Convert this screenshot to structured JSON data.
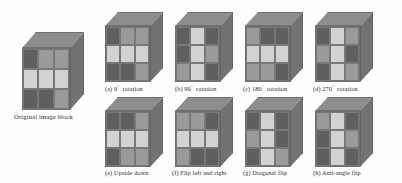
{
  "figure": {
    "type": "diagram",
    "shades": {
      "dark": "#5f5f5f",
      "mid": "#9a9a9a",
      "light": "#d2d2d2",
      "top_face": "#8d8d8d",
      "right_face": "#727272",
      "background": "#fdfdfd"
    }
  },
  "original": {
    "caption": "Original image block",
    "grid": [
      [
        "dark",
        "mid",
        "mid"
      ],
      [
        "light",
        "light",
        "light"
      ],
      [
        "dark",
        "dark",
        "mid"
      ]
    ]
  },
  "panels": [
    {
      "id": "a",
      "label": "(a) 0",
      "degree": "°",
      "suffix": "rotation",
      "caption": "(a) 0° rotation",
      "grid": [
        [
          "dark",
          "mid",
          "mid"
        ],
        [
          "light",
          "light",
          "light"
        ],
        [
          "dark",
          "dark",
          "mid"
        ]
      ]
    },
    {
      "id": "b",
      "label": "(b) 90",
      "degree": "°",
      "suffix": "rotation",
      "caption": "(b) 90° rotation",
      "grid": [
        [
          "dark",
          "light",
          "dark"
        ],
        [
          "dark",
          "light",
          "mid"
        ],
        [
          "mid",
          "light",
          "dark"
        ]
      ]
    },
    {
      "id": "c",
      "label": "(c) 180",
      "degree": "°",
      "suffix": "rotation",
      "caption": "(c) 180° rotation",
      "grid": [
        [
          "mid",
          "dark",
          "dark"
        ],
        [
          "light",
          "light",
          "light"
        ],
        [
          "mid",
          "mid",
          "dark"
        ]
      ]
    },
    {
      "id": "d",
      "label": "(d) 270",
      "degree": "°",
      "suffix": "rotation",
      "caption": "(d) 270° rotation",
      "grid": [
        [
          "dark",
          "light",
          "mid"
        ],
        [
          "mid",
          "light",
          "dark"
        ],
        [
          "dark",
          "light",
          "mid"
        ]
      ]
    },
    {
      "id": "e",
      "label": "(e) Upside down",
      "degree": "",
      "suffix": "",
      "caption": "(e) Upside down",
      "grid": [
        [
          "dark",
          "dark",
          "mid"
        ],
        [
          "light",
          "light",
          "light"
        ],
        [
          "dark",
          "mid",
          "mid"
        ]
      ]
    },
    {
      "id": "f",
      "label": "(f) Flip left and right",
      "degree": "",
      "suffix": "",
      "caption": "(f) Flip left and right",
      "grid": [
        [
          "mid",
          "mid",
          "dark"
        ],
        [
          "light",
          "light",
          "light"
        ],
        [
          "mid",
          "dark",
          "dark"
        ]
      ]
    },
    {
      "id": "g",
      "label": "(g) Diagonal flip",
      "degree": "",
      "suffix": "",
      "caption": "(g) Diagonal flip",
      "grid": [
        [
          "dark",
          "light",
          "dark"
        ],
        [
          "mid",
          "light",
          "dark"
        ],
        [
          "dark",
          "light",
          "mid"
        ]
      ]
    },
    {
      "id": "h",
      "label": "(h) Anti-angle flip",
      "degree": "",
      "suffix": "",
      "caption": "(h) Anti-angle flip",
      "grid": [
        [
          "mid",
          "light",
          "dark"
        ],
        [
          "dark",
          "light",
          "mid"
        ],
        [
          "dark",
          "light",
          "dark"
        ]
      ]
    }
  ]
}
